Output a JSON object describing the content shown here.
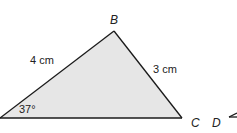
{
  "diagram": {
    "type": "triangle",
    "fill_color": "#e6e6e6",
    "stroke_color": "#1a1a1a",
    "vertices": {
      "B": "B",
      "C": "C",
      "D": "D"
    },
    "sides": {
      "AB": "4 cm",
      "BC": "3 cm"
    },
    "angle_A": "37°"
  }
}
